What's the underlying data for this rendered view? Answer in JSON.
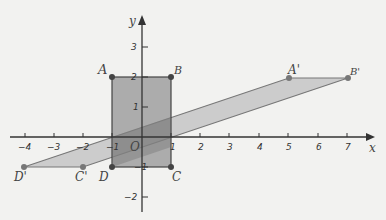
{
  "axes": {
    "x_label": "x",
    "y_label": "y",
    "origin_label": "O",
    "x_ticks": [
      "−4",
      "−3",
      "−2",
      "−1",
      "1",
      "2",
      "3",
      "4",
      "5",
      "6",
      "7"
    ],
    "y_ticks": [
      "3",
      "2",
      "1",
      "−1",
      "−2"
    ]
  },
  "rectangle_ABCD": {
    "vertices": [
      {
        "name": "A",
        "x": -1,
        "y": 2
      },
      {
        "name": "B",
        "x": 1,
        "y": 2
      },
      {
        "name": "C",
        "x": 1,
        "y": -1
      },
      {
        "name": "D",
        "x": -1,
        "y": -1
      }
    ],
    "fill": "#9a9a9a"
  },
  "parallelogram_A'B'C'D'": {
    "vertices": [
      {
        "name": "A'",
        "x": 5,
        "y": 2
      },
      {
        "name": "B'",
        "x": 7,
        "y": 2
      },
      {
        "name": "C'",
        "x": -2,
        "y": -1
      },
      {
        "name": "D'",
        "x": -4,
        "y": -1
      }
    ],
    "fill": "#c8c8c8"
  },
  "labels": {
    "A": "A",
    "B": "B",
    "C": "C",
    "D": "D",
    "A2": "A'",
    "B2": "B'",
    "C2": "C'",
    "D2": "D'"
  },
  "colors": {
    "background": "#f2f2f0",
    "axis": "#333333",
    "edge": "#666666",
    "point": "#555555"
  }
}
